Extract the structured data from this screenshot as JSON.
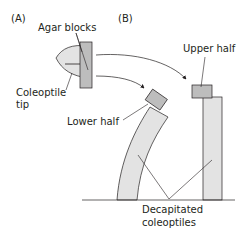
{
  "panels": {
    "a": {
      "label": "(A)"
    },
    "b": {
      "label": "(B)"
    }
  },
  "labels": {
    "agar_blocks": "Agar blocks",
    "coleoptile_tip_line1": "Coleoptile",
    "coleoptile_tip_line2": "tip",
    "upper_half": "Upper half",
    "lower_half": "Lower half",
    "decapitated_line1": "Decapitated",
    "decapitated_line2": "coleoptiles"
  },
  "colors": {
    "agar_block_fill": "#bdbdbd",
    "coleoptile_fill": "#e3e3e3",
    "stroke": "#231f20"
  }
}
